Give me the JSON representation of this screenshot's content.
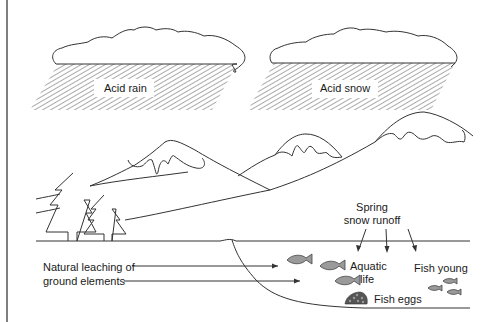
{
  "diagram": {
    "labels": {
      "acid_rain": "Acid rain",
      "acid_snow": "Acid snow",
      "spring_line1": "Spring",
      "spring_line2": "snow runoff",
      "aquatic_line1": "Aquatic",
      "aquatic_line2": "life",
      "fish_young": "Fish young",
      "fish_eggs": "Fish eggs",
      "leaching_line1": "Natural leaching of",
      "leaching_line2": "ground elements"
    },
    "colors": {
      "line": "#333333",
      "fish_fill": "#9a9a9a",
      "background": "#ffffff"
    }
  }
}
